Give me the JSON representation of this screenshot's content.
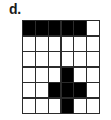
{
  "figure": {
    "label": "d.",
    "caption_visible": true
  },
  "colors": {
    "filled": "#000000",
    "empty": "#ffffff",
    "gridline": "#2b2b2b",
    "label_text": "#1a1a1a",
    "page_background": "#ffffff"
  },
  "grid": {
    "rows": 6,
    "columns": 6,
    "cells": [
      [
        "filled",
        "filled",
        "filled",
        "filled",
        "filled",
        "empty"
      ],
      [
        "empty",
        "empty",
        "empty",
        "empty",
        "empty",
        "empty"
      ],
      [
        "empty",
        "empty",
        "empty",
        "empty",
        "empty",
        "empty"
      ],
      [
        "empty",
        "empty",
        "empty",
        "filled",
        "empty",
        "empty"
      ],
      [
        "empty",
        "empty",
        "filled",
        "filled",
        "filled",
        "empty"
      ],
      [
        "empty",
        "empty",
        "empty",
        "filled",
        "empty",
        "empty"
      ]
    ],
    "filled_count": 10,
    "empty_count": 26
  }
}
